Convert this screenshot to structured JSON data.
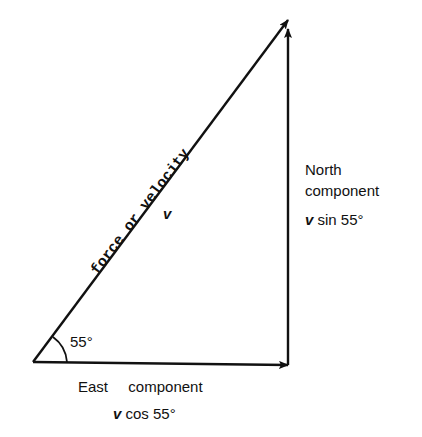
{
  "diagram": {
    "type": "vector-resolution-triangle",
    "colors": {
      "line": "#111111",
      "background": "#ffffff"
    },
    "hypotenuse": {
      "label": "force or velocity",
      "symbol": "v"
    },
    "angle": {
      "label": "55°"
    },
    "east": {
      "label_word1": "East",
      "label_word2": "component",
      "formula_var": "v",
      "formula": " cos 55°"
    },
    "north": {
      "label_line1": "North",
      "label_line2": "component",
      "formula_var": "v",
      "formula": " sin 55°"
    }
  }
}
